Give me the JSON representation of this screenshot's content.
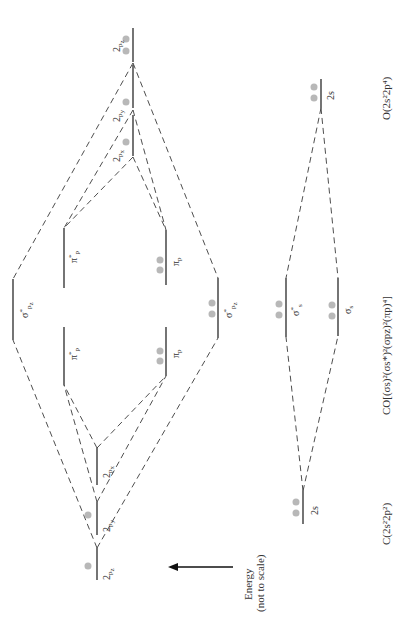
{
  "diagram": {
    "orientation": "rotated 90 degrees counter-clockwise",
    "colors": {
      "line": "#2a2a2a",
      "electron": "#b8b8b8"
    },
    "left_atom": {
      "label": "C(2s²2p²)",
      "orbitals": [
        {
          "name": "2s",
          "label": "2s",
          "electrons": 2
        },
        {
          "name": "2px",
          "label": "2pₓ",
          "electrons": 0
        },
        {
          "name": "2py",
          "label": "2p_y",
          "electrons": 1
        },
        {
          "name": "2pz",
          "label": "2p_z",
          "electrons": 1
        }
      ]
    },
    "right_atom": {
      "label": "O(2s²2p⁴)",
      "orbitals": [
        {
          "name": "2s",
          "label": "2s",
          "electrons": 2
        },
        {
          "name": "2px",
          "label": "2pₓ",
          "electrons": 1
        },
        {
          "name": "2py",
          "label": "2p_y",
          "electrons": 1
        },
        {
          "name": "2pz",
          "label": "2p_z",
          "electrons": 2
        }
      ]
    },
    "molecule": {
      "label": "CO[(σs)²(σs*)²(σpz)²(πp)⁴]",
      "orbitals": [
        {
          "name": "sigma_s",
          "label": "σs",
          "electrons": 2
        },
        {
          "name": "sigma_s_star",
          "label": "σ*s",
          "electrons": 2
        },
        {
          "name": "sigma_pz",
          "label": "σ*pz",
          "electrons": 2
        },
        {
          "name": "pi_p_1",
          "label": "πp",
          "electrons": 2
        },
        {
          "name": "pi_p_2",
          "label": "πp",
          "electrons": 2
        },
        {
          "name": "pi_p_star_1",
          "label": "π*p",
          "electrons": 0
        },
        {
          "name": "pi_p_star_2",
          "label": "π*p",
          "electrons": 0
        },
        {
          "name": "sigma_pz_star",
          "label": "σ*pz",
          "electrons": 0
        }
      ]
    },
    "energy_axis": {
      "label_line1": "Energy",
      "label_line2": "(not to scale)"
    },
    "labels": {
      "two": "2",
      "p": "p",
      "s": "s",
      "x": "x",
      "y": "y",
      "z": "z",
      "sigma": "σ",
      "pi": "π",
      "star": "*",
      "twos": "2s",
      "C_config": "C(2s²2p²)",
      "O_config": "O(2s²2p⁴)",
      "CO_config": "CO[(σs)²(σs*)²(σpz)²(πp)⁴]",
      "energy": "Energy",
      "not_to_scale": "(not to scale)"
    }
  }
}
